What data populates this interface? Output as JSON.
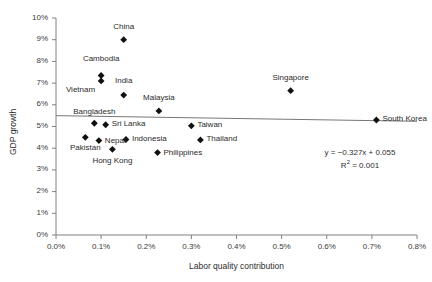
{
  "chart_data": {
    "type": "scatter",
    "title": "",
    "xlabel": "Labor quality contribution",
    "ylabel": "GDP growth",
    "xlim": [
      0.0,
      0.008
    ],
    "ylim": [
      0.0,
      0.1
    ],
    "grid": false,
    "legend": "none",
    "xticks": [
      "0.0%",
      "0.1%",
      "0.2%",
      "0.3%",
      "0.4%",
      "0.5%",
      "0.6%",
      "0.7%",
      "0.8%"
    ],
    "xtick_values": [
      0.0,
      0.001,
      0.002,
      0.003,
      0.004,
      0.005,
      0.006,
      0.007,
      0.008
    ],
    "yticks": [
      "0%",
      "1%",
      "2%",
      "3%",
      "4%",
      "5%",
      "6%",
      "7%",
      "8%",
      "9%",
      "10%"
    ],
    "ytick_values": [
      0.0,
      0.01,
      0.02,
      0.03,
      0.04,
      0.05,
      0.06,
      0.07,
      0.08,
      0.09,
      0.1
    ],
    "marker_color": "#111111",
    "trendline_color": "#777777",
    "axis_color": "#808080",
    "points": [
      {
        "name": "China",
        "x": 0.0015,
        "y": 0.09,
        "label_dx": 0,
        "label_dy": -12,
        "label_align": "center"
      },
      {
        "name": "Cambodia",
        "x": 0.001,
        "y": 0.0735,
        "label_dx": 0,
        "label_dy": -16,
        "label_align": "center"
      },
      {
        "name": "Vietnam",
        "x": 0.001,
        "y": 0.071,
        "label_dx": -6,
        "label_dy": 10,
        "label_align": "right"
      },
      {
        "name": "India",
        "x": 0.0015,
        "y": 0.0645,
        "label_dx": 0,
        "label_dy": -14,
        "label_align": "center"
      },
      {
        "name": "Malaysia",
        "x": 0.00228,
        "y": 0.0572,
        "label_dx": 0,
        "label_dy": -12,
        "label_align": "center"
      },
      {
        "name": "Bangladesh",
        "x": 0.00085,
        "y": 0.0515,
        "label_dx": 0,
        "label_dy": -11,
        "label_align": "center"
      },
      {
        "name": "Sri Lanka",
        "x": 0.0011,
        "y": 0.0508,
        "label_dx": 6,
        "label_dy": 0,
        "label_align": "left"
      },
      {
        "name": "Taiwan",
        "x": 0.003,
        "y": 0.0503,
        "label_dx": 6,
        "label_dy": 0,
        "label_align": "left"
      },
      {
        "name": "Pakistan",
        "x": 0.00065,
        "y": 0.045,
        "label_dx": 0,
        "label_dy": 11,
        "label_align": "center"
      },
      {
        "name": "Nepal",
        "x": 0.00095,
        "y": 0.0435,
        "label_dx": 6,
        "label_dy": 1,
        "label_align": "left"
      },
      {
        "name": "Indonesia",
        "x": 0.00155,
        "y": 0.044,
        "label_dx": 6,
        "label_dy": 0,
        "label_align": "left"
      },
      {
        "name": "Thailand",
        "x": 0.0032,
        "y": 0.0438,
        "label_dx": 6,
        "label_dy": 0,
        "label_align": "left"
      },
      {
        "name": "Hong Kong",
        "x": 0.00125,
        "y": 0.0395,
        "label_dx": 0,
        "label_dy": 12,
        "label_align": "center"
      },
      {
        "name": "Philippines",
        "x": 0.00225,
        "y": 0.038,
        "label_dx": 6,
        "label_dy": 1,
        "label_align": "left"
      },
      {
        "name": "Singapore",
        "x": 0.0052,
        "y": 0.0665,
        "label_dx": 0,
        "label_dy": -12,
        "label_align": "center"
      },
      {
        "name": "South Korea",
        "x": 0.0071,
        "y": 0.053,
        "label_dx": 6,
        "label_dy": 0,
        "label_align": "left"
      }
    ],
    "trendline": {
      "slope": -0.327,
      "intercept": 0.055,
      "r_squared": 0.001,
      "equation_text": "y = −0.327x + 0.055",
      "r2_prefix": "R",
      "r2_exponent": "2",
      "r2_text": " = 0.001"
    }
  }
}
